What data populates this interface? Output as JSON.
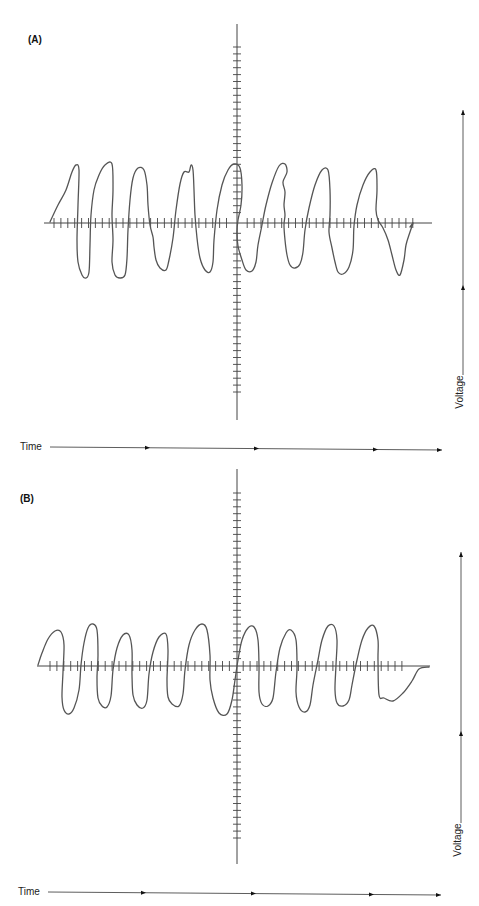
{
  "figure": {
    "panels": [
      {
        "id": "A",
        "label": "(A)",
        "label_pos": [
          28,
          43
        ],
        "origin": [
          237,
          223
        ],
        "x_axis": {
          "x1": 44,
          "x2": 432,
          "tick_from": 54,
          "tick_to": 416,
          "tick_step": 6.9,
          "tick_half": 5
        },
        "y_axis": {
          "y1": 24,
          "y2": 420,
          "tick_from": 47,
          "tick_to": 398,
          "tick_step": 6.9,
          "tick_half": 4
        },
        "wave_description": "Irregular, jagged waveform with 8 cycles; ragged amplitude and noisy edges",
        "cycles": 8,
        "wave_points": [
          [
            50,
            222
          ],
          [
            58,
            205
          ],
          [
            66,
            190
          ],
          [
            72,
            172
          ],
          [
            76,
            165
          ],
          [
            79,
            170
          ],
          [
            78,
            205
          ],
          [
            77,
            240
          ],
          [
            78,
            262
          ],
          [
            82,
            275
          ],
          [
            86,
            278
          ],
          [
            89,
            272
          ],
          [
            90,
            245
          ],
          [
            91,
            215
          ],
          [
            94,
            190
          ],
          [
            99,
            175
          ],
          [
            105,
            165
          ],
          [
            112,
            164
          ],
          [
            113,
            190
          ],
          [
            112,
            215
          ],
          [
            113,
            240
          ],
          [
            112,
            262
          ],
          [
            115,
            275
          ],
          [
            120,
            278
          ],
          [
            125,
            275
          ],
          [
            127,
            258
          ],
          [
            128,
            230
          ],
          [
            130,
            200
          ],
          [
            133,
            178
          ],
          [
            138,
            168
          ],
          [
            144,
            170
          ],
          [
            147,
            185
          ],
          [
            148,
            205
          ],
          [
            150,
            225
          ],
          [
            153,
            237
          ],
          [
            154,
            247
          ],
          [
            156,
            260
          ],
          [
            160,
            268
          ],
          [
            166,
            270
          ],
          [
            169,
            260
          ],
          [
            173,
            238
          ],
          [
            176,
            210
          ],
          [
            180,
            184
          ],
          [
            184,
            172
          ],
          [
            189,
            172
          ],
          [
            191,
            165
          ],
          [
            193,
            170
          ],
          [
            194,
            190
          ],
          [
            195,
            215
          ],
          [
            197,
            238
          ],
          [
            200,
            258
          ],
          [
            205,
            270
          ],
          [
            210,
            272
          ],
          [
            213,
            262
          ],
          [
            214,
            240
          ],
          [
            217,
            210
          ],
          [
            222,
            185
          ],
          [
            228,
            170
          ],
          [
            234,
            164
          ],
          [
            240,
            168
          ],
          [
            242,
            185
          ],
          [
            241,
            205
          ],
          [
            238,
            220
          ],
          [
            237,
            232
          ],
          [
            238,
            246
          ],
          [
            242,
            260
          ],
          [
            246,
            270
          ],
          [
            252,
            271
          ],
          [
            256,
            262
          ],
          [
            258,
            245
          ],
          [
            262,
            225
          ],
          [
            266,
            205
          ],
          [
            272,
            183
          ],
          [
            279,
            166
          ],
          [
            285,
            164
          ],
          [
            287,
            172
          ],
          [
            283,
            182
          ],
          [
            285,
            192
          ],
          [
            284,
            205
          ],
          [
            285,
            215
          ],
          [
            284,
            225
          ],
          [
            285,
            240
          ],
          [
            287,
            255
          ],
          [
            290,
            265
          ],
          [
            295,
            268
          ],
          [
            300,
            264
          ],
          [
            303,
            252
          ],
          [
            305,
            230
          ],
          [
            309,
            208
          ],
          [
            315,
            185
          ],
          [
            322,
            170
          ],
          [
            328,
            170
          ],
          [
            330,
            190
          ],
          [
            330,
            215
          ],
          [
            329,
            232
          ],
          [
            332,
            248
          ],
          [
            335,
            262
          ],
          [
            338,
            272
          ],
          [
            343,
            274
          ],
          [
            349,
            267
          ],
          [
            353,
            250
          ],
          [
            354,
            226
          ],
          [
            357,
            205
          ],
          [
            363,
            185
          ],
          [
            370,
            172
          ],
          [
            376,
            170
          ],
          [
            377,
            190
          ],
          [
            376,
            210
          ],
          [
            378,
            220
          ],
          [
            383,
            228
          ],
          [
            388,
            240
          ],
          [
            392,
            255
          ],
          [
            396,
            270
          ],
          [
            400,
            275
          ],
          [
            404,
            260
          ],
          [
            406,
            245
          ],
          [
            410,
            232
          ],
          [
            413,
            223
          ],
          [
            410,
            227
          ]
        ],
        "voltage_arrow": {
          "x": 463,
          "y_bottom": 375,
          "y_top": 110,
          "mid_marker": 285
        },
        "voltage_label": "Voltage",
        "voltage_label_pos": [
          460,
          392
        ],
        "time_arrow": {
          "y": 447,
          "x1": 50,
          "x2": 442,
          "markers": [
            148,
            257,
            376
          ]
        },
        "time_label": "Time",
        "time_label_pos": [
          20,
          450
        ]
      },
      {
        "id": "B",
        "label": "(B)",
        "label_pos": [
          20,
          502
        ],
        "origin": [
          237,
          666
        ],
        "x_axis": {
          "x1": 37,
          "x2": 430,
          "tick_from": 50,
          "tick_to": 407,
          "tick_step": 6.9,
          "tick_half": 5
        },
        "y_axis": {
          "y1": 469,
          "y2": 864,
          "tick_from": 493,
          "tick_to": 842,
          "tick_step": 6.9,
          "tick_half": 4
        },
        "wave_description": "Smoother, regular waveform with 8 cycles; rounded peaks and troughs",
        "cycles": 8,
        "wave_points": [
          [
            38,
            665
          ],
          [
            42,
            653
          ],
          [
            48,
            639
          ],
          [
            55,
            631
          ],
          [
            61,
            632
          ],
          [
            64,
            645
          ],
          [
            63,
            672
          ],
          [
            62,
            697
          ],
          [
            64,
            710
          ],
          [
            69,
            714
          ],
          [
            74,
            708
          ],
          [
            79,
            690
          ],
          [
            81,
            665
          ],
          [
            84,
            643
          ],
          [
            88,
            628
          ],
          [
            93,
            624
          ],
          [
            97,
            630
          ],
          [
            98,
            655
          ],
          [
            97,
            678
          ],
          [
            98,
            698
          ],
          [
            102,
            706
          ],
          [
            107,
            707
          ],
          [
            111,
            696
          ],
          [
            113,
            670
          ],
          [
            117,
            648
          ],
          [
            123,
            635
          ],
          [
            129,
            635
          ],
          [
            132,
            650
          ],
          [
            132,
            675
          ],
          [
            133,
            695
          ],
          [
            137,
            705
          ],
          [
            143,
            708
          ],
          [
            147,
            700
          ],
          [
            149,
            674
          ],
          [
            153,
            652
          ],
          [
            159,
            637
          ],
          [
            166,
            634
          ],
          [
            168,
            650
          ],
          [
            167,
            680
          ],
          [
            168,
            697
          ],
          [
            172,
            704
          ],
          [
            179,
            706
          ],
          [
            183,
            694
          ],
          [
            185,
            670
          ],
          [
            189,
            645
          ],
          [
            195,
            630
          ],
          [
            202,
            624
          ],
          [
            207,
            630
          ],
          [
            210,
            655
          ],
          [
            210,
            680
          ],
          [
            213,
            698
          ],
          [
            219,
            713
          ],
          [
            227,
            714
          ],
          [
            232,
            700
          ],
          [
            235,
            680
          ],
          [
            238,
            660
          ],
          [
            242,
            640
          ],
          [
            248,
            628
          ],
          [
            254,
            627
          ],
          [
            258,
            640
          ],
          [
            259,
            665
          ],
          [
            259,
            692
          ],
          [
            262,
            704
          ],
          [
            268,
            706
          ],
          [
            273,
            698
          ],
          [
            276,
            672
          ],
          [
            280,
            648
          ],
          [
            286,
            633
          ],
          [
            291,
            630
          ],
          [
            296,
            640
          ],
          [
            297,
            668
          ],
          [
            296,
            692
          ],
          [
            299,
            707
          ],
          [
            305,
            712
          ],
          [
            310,
            705
          ],
          [
            313,
            685
          ],
          [
            318,
            660
          ],
          [
            322,
            640
          ],
          [
            328,
            626
          ],
          [
            334,
            626
          ],
          [
            337,
            640
          ],
          [
            336,
            665
          ],
          [
            335,
            690
          ],
          [
            337,
            703
          ],
          [
            343,
            706
          ],
          [
            349,
            700
          ],
          [
            352,
            685
          ],
          [
            357,
            660
          ],
          [
            362,
            640
          ],
          [
            368,
            628
          ],
          [
            374,
            626
          ],
          [
            378,
            640
          ],
          [
            378,
            660
          ],
          [
            379,
            695
          ],
          [
            384,
            698
          ],
          [
            393,
            701
          ],
          [
            403,
            693
          ],
          [
            412,
            681
          ],
          [
            419,
            669
          ],
          [
            429,
            667
          ]
        ],
        "voltage_arrow": {
          "x": 461,
          "y_bottom": 823,
          "y_top": 552,
          "mid_marker": 731
        },
        "voltage_label": "Voltage",
        "voltage_label_pos": [
          458,
          840
        ],
        "time_arrow": {
          "y": 892,
          "x1": 48,
          "x2": 441,
          "markers": [
            144,
            254,
            372
          ]
        },
        "time_label": "Time",
        "time_label_pos": [
          18,
          895
        ]
      }
    ]
  }
}
